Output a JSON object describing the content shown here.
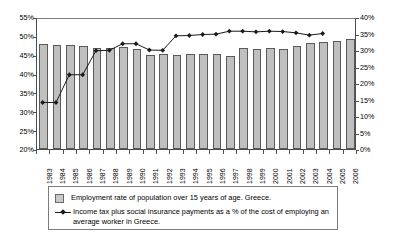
{
  "chart_data": {
    "type": "bar",
    "title": "",
    "subtitle": "",
    "xlabel": "",
    "ylabel": "",
    "categories": [
      "1983",
      "1984",
      "1985",
      "1986",
      "1987",
      "1988",
      "1989",
      "1990",
      "1991",
      "1992",
      "1993",
      "1994",
      "1995",
      "1996",
      "1997",
      "1998",
      "1999",
      "2000",
      "2001",
      "2002",
      "2003",
      "2004",
      "2005",
      "2006"
    ],
    "grid": false,
    "legend_position": "bottom",
    "axes": {
      "left": {
        "label": "",
        "min": 20,
        "max": 55,
        "step": 5,
        "ticks": [
          "20%",
          "25%",
          "30%",
          "35%",
          "40%",
          "45%",
          "50%",
          "55%"
        ],
        "tick_values": [
          20,
          25,
          30,
          35,
          40,
          45,
          50,
          55
        ]
      },
      "right": {
        "label": "",
        "min": 0,
        "max": 40,
        "step": 5,
        "ticks": [
          "0%",
          "5%",
          "10%",
          "15%",
          "20%",
          "25%",
          "30%",
          "35%",
          "40%"
        ],
        "tick_values": [
          0,
          5,
          10,
          15,
          20,
          25,
          30,
          35,
          40
        ]
      }
    },
    "series": [
      {
        "name": "Employment rate of population over 15 years of age. Greece.",
        "type": "bar",
        "axis": "left",
        "color": "#bfbfbf",
        "border_color": "#5a5a5a",
        "values": [
          47.8,
          47.6,
          47.6,
          47.2,
          46.7,
          46.8,
          47.0,
          46.5,
          44.9,
          45.2,
          44.9,
          45.1,
          45.1,
          45.3,
          44.7,
          46.8,
          46.6,
          46.8,
          46.5,
          47.4,
          48.1,
          48.4,
          48.6,
          49.2
        ]
      },
      {
        "name": "Income tax plus social insurance payments as a % of the cost of employing an average worker in Greece.",
        "type": "line",
        "axis": "right",
        "color": "#1a1a1a",
        "marker": "diamond",
        "x": [
          "1983",
          "1984",
          "1985",
          "1986",
          "1987",
          "1988",
          "1989",
          "1990",
          "1991",
          "1992",
          "1993",
          "1994",
          "1995",
          "1996",
          "1997",
          "1998",
          "1999",
          "2000",
          "2001",
          "2002",
          "2003",
          "2004"
        ],
        "values": [
          14.4,
          14.4,
          22.8,
          22.8,
          30.1,
          30.2,
          32.2,
          32.2,
          30.3,
          30.2,
          34.6,
          34.7,
          35.0,
          35.1,
          36.0,
          36.0,
          35.8,
          36.0,
          35.9,
          35.5,
          34.8,
          35.3
        ]
      }
    ]
  },
  "legend": {
    "items": [
      {
        "marker": "bar-swatch",
        "label": "Employment rate of population over 15 years of age. Greece."
      },
      {
        "marker": "line-diamond",
        "label": "Income tax plus social insurance payments as a % of the cost of employing an average worker in Greece."
      }
    ]
  }
}
